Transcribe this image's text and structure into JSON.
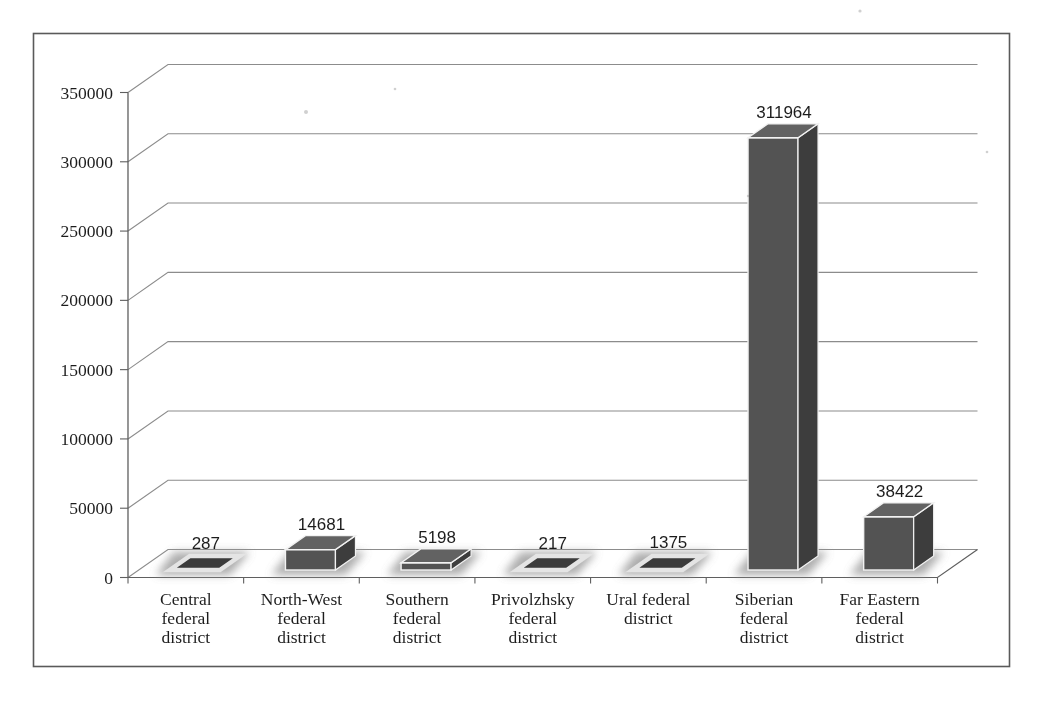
{
  "chart_data": {
    "type": "bar",
    "variant": "3d-column",
    "title": "",
    "categories": [
      "Central federal district",
      "North-West federal district",
      "Southern federal district",
      "Privolzhsky federal district",
      "Ural federal district",
      "Siberian federal district",
      "Far Eastern federal district"
    ],
    "category_label_lines": [
      [
        "Central",
        "federal",
        "district"
      ],
      [
        "North-West",
        "federal",
        "district"
      ],
      [
        "Southern",
        "federal",
        "district"
      ],
      [
        "Privolzhsky",
        "federal",
        "district"
      ],
      [
        "Ural federal",
        "district"
      ],
      [
        "Siberian",
        "federal",
        "district"
      ],
      [
        "Far Eastern",
        "federal",
        "district"
      ]
    ],
    "values": [
      287,
      14681,
      5198,
      217,
      1375,
      311964,
      38422
    ],
    "data_labels": [
      "287",
      "14681",
      "5198",
      "217",
      "1375",
      "311964",
      "38422"
    ],
    "y_axis": {
      "min": 0,
      "max": 350000,
      "step": 50000,
      "tick_labels": [
        "0",
        "50000",
        "100000",
        "150000",
        "200000",
        "250000",
        "300000",
        "350000"
      ]
    },
    "x_axis_label": "",
    "y_axis_label": "",
    "legend": [],
    "legend_position": "none",
    "grid": true,
    "colors": {
      "bar_front": "#535353",
      "bar_top": "#626262",
      "bar_side": "#3e3e3e",
      "bar_edge": "#f2f2f2",
      "flat_fill": "#3a3a3a",
      "flat_rim": "#e4e4e4",
      "shadow": "#999999",
      "gridline": "#8c8c8c",
      "axis": "#5f5f5f",
      "text": "#1f1f1f",
      "figure_border": "#5a5a5a",
      "background": "#ffffff"
    }
  }
}
